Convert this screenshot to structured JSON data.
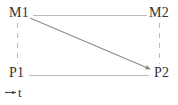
{
  "diagram": {
    "type": "message-sequence-chart",
    "nodes": [
      {
        "id": "m1",
        "label": "M1",
        "x": 20,
        "y": 15
      },
      {
        "id": "m2",
        "label": "M2",
        "x": 159,
        "y": 15
      },
      {
        "id": "p1",
        "label": "P1",
        "x": 20,
        "y": 75
      },
      {
        "id": "p2",
        "label": "P2",
        "x": 159,
        "y": 75
      }
    ],
    "edges": [
      {
        "id": "m1-m2",
        "from": "M1",
        "to": "M2",
        "style": "solid",
        "arrow": "none"
      },
      {
        "id": "p1-p2",
        "from": "P1",
        "to": "P2",
        "style": "solid",
        "arrow": "none"
      },
      {
        "id": "m1-p1",
        "from": "M1",
        "to": "P1",
        "style": "dashed",
        "arrow": "none"
      },
      {
        "id": "m2-p2",
        "from": "M2",
        "to": "P2",
        "style": "dashed",
        "arrow": "none"
      },
      {
        "id": "m1-p2",
        "from": "M1",
        "to": "P2",
        "style": "solid",
        "arrow": "end"
      }
    ],
    "axis": {
      "label": "t",
      "arrow": "right"
    },
    "colors": {
      "line": "#b9b9b9",
      "dashed_line": "#bdbdbd",
      "arrow_line": "#8a8a8a",
      "text": "#333333",
      "background": "#ffffff"
    }
  }
}
